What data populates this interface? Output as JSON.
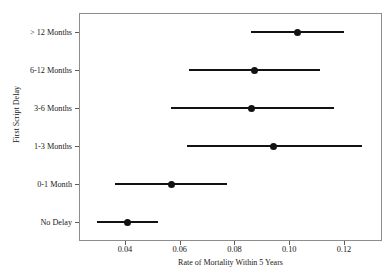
{
  "chart_data": {
    "type": "scatter",
    "title": "",
    "xlabel": "Rate of Mortality Within 5 Years",
    "ylabel": "First Script Delay",
    "categories": [
      "No Delay",
      "0-1 Month",
      "1-3 Months",
      "3-6 Months",
      "6-12 Months",
      "> 12 Months"
    ],
    "xlim": [
      0.0232,
      0.1339
    ],
    "ylim": [
      0,
      6
    ],
    "grid": false,
    "legend": "none",
    "xticks": [
      0.04,
      0.06,
      0.08,
      0.1,
      0.12
    ],
    "xtick_labels": [
      "0.04",
      "0.06",
      "0.08",
      "0.10",
      "0.12"
    ],
    "series": [
      {
        "name": "Rate of Mortality Within 5 Years",
        "marker": "filled-circle",
        "error_bars": "horizontal-confidence-interval",
        "points": [
          {
            "category": "> 12 Months",
            "value": 0.1032,
            "low": 0.0862,
            "high": 0.12
          },
          {
            "category": "6-12 Months",
            "value": 0.0872,
            "low": 0.0634,
            "high": 0.1113
          },
          {
            "category": "3-6 Months",
            "value": 0.0864,
            "low": 0.0568,
            "high": 0.1164
          },
          {
            "category": "1-3 Months",
            "value": 0.0944,
            "low": 0.0625,
            "high": 0.1265
          },
          {
            "category": "0-1 Month",
            "value": 0.0569,
            "low": 0.0363,
            "high": 0.0772
          },
          {
            "category": "No Delay",
            "value": 0.041,
            "low": 0.0299,
            "high": 0.0522
          }
        ]
      }
    ],
    "colors": {
      "marker": "#121212",
      "line": "#121212",
      "frame": "#8d8d8d",
      "text": "#1a1a1a",
      "background": "#ffffff"
    }
  },
  "axes": {
    "y_title": "First Script Delay",
    "x_title": "Rate of Mortality Within 5 Years",
    "y_labels": [
      "> 12 Months",
      "6-12 Months",
      "3-6 Months",
      "1-3 Months",
      "0-1 Month",
      "No Delay"
    ],
    "x_labels": [
      "0.04",
      "0.06",
      "0.08",
      "0.10",
      "0.12"
    ]
  },
  "header": {
    "title": ""
  }
}
